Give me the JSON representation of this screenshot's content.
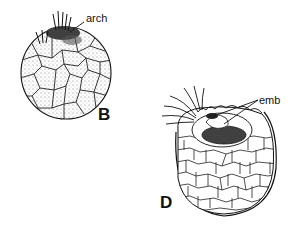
{
  "figure": {
    "panels": [
      {
        "id": "B",
        "panel_label": "B",
        "annotations": [
          {
            "label": "arch"
          }
        ]
      },
      {
        "id": "D",
        "panel_label": "D",
        "annotations": [
          {
            "label": "emb"
          }
        ]
      }
    ]
  },
  "colors": {
    "ink": "#111111",
    "stipple": "#9a9a9a",
    "dark_mass": "#222222",
    "background": "#ffffff"
  }
}
